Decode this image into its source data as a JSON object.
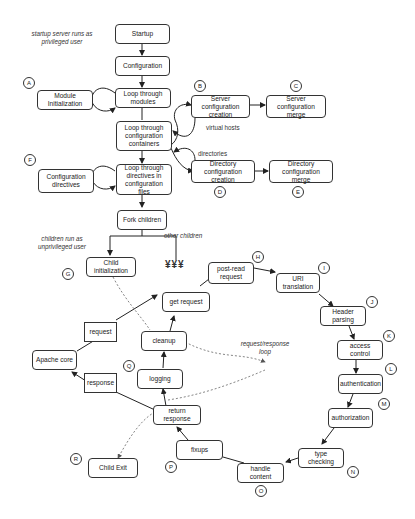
{
  "notes": {
    "startup": "startup server runs as\nprivileged user",
    "children": "children run as\nunprivileged user",
    "loop": "request/response\nloop"
  },
  "boxes": {
    "startup": "Startup",
    "configuration": "Configuration",
    "loop_modules": "Loop through\nmodules",
    "module_init": "Module Initialization",
    "server_config_creation": "Server configuration\ncreation",
    "server_config_merge": "Server configuration\nmerge",
    "loop_containers": "Loop through\nconfiguration\ncontainers",
    "dir_config_creation": "Directory configuration\ncreation",
    "dir_config_merge": "Directory configuration\nmerge",
    "loop_directives": "Loop through\ndirectives in\nconfiguration files",
    "config_directives": "Configuration\ndirectives",
    "fork_children": "Fork children",
    "child_init": "Child initialization",
    "get_request": "get request",
    "post_read": "post-read\nrequest",
    "uri_translation": "URI translation",
    "header_parsing": "Header parsing",
    "access_control": "access control",
    "authentication": "authentication",
    "authorization": "authorization",
    "type_checking": "type checking",
    "handle_content": "handle content",
    "fixups": "fixups",
    "return_response": "return response",
    "logging": "logging",
    "cleanup": "cleanup",
    "apache_core": "Apache core",
    "request": "request",
    "response": "response",
    "child_exit": "Child Exit"
  },
  "edge_labels": {
    "virtual_hosts": "virtual hosts",
    "directories": "directories",
    "other_children": "other children",
    "children_symbol": "¥¥¥"
  },
  "markers": {
    "A": "A",
    "B": "B",
    "C": "C",
    "D": "D",
    "E": "E",
    "F": "F",
    "G": "G",
    "H": "H",
    "I": "I",
    "J": "J",
    "K": "K",
    "L": "L",
    "M": "M",
    "N": "N",
    "O": "O",
    "P": "P",
    "Q": "Q",
    "R": "R"
  }
}
